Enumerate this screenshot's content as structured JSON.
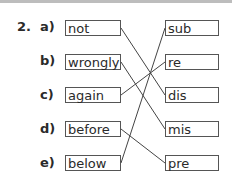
{
  "exercise": {
    "number": "2.",
    "items": [
      {
        "label": "a)",
        "word": "not"
      },
      {
        "label": "b)",
        "word": "wrongly"
      },
      {
        "label": "c)",
        "word": "again"
      },
      {
        "label": "d)",
        "word": "before"
      },
      {
        "label": "e)",
        "word": "below"
      }
    ],
    "prefixes": [
      "sub",
      "re",
      "dis",
      "mis",
      "pre"
    ],
    "matches": [
      {
        "word": "not",
        "prefix": "dis"
      },
      {
        "word": "wrongly",
        "prefix": "mis"
      },
      {
        "word": "again",
        "prefix": "re"
      },
      {
        "word": "before",
        "prefix": "pre"
      },
      {
        "word": "below",
        "prefix": "sub"
      }
    ]
  }
}
